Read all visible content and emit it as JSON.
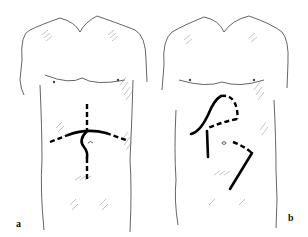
{
  "figure": {
    "panels": [
      {
        "id": "a",
        "label": "a",
        "description": "Anterior torso with vertical midline incision curving around umbilicus and transverse upper-abdominal incision",
        "incisions": [
          {
            "name": "midline-upper",
            "style": "dashed"
          },
          {
            "name": "transverse-center",
            "style": "solid"
          },
          {
            "name": "transverse-left-extension",
            "style": "dashed"
          },
          {
            "name": "transverse-right-extension",
            "style": "dashed"
          },
          {
            "name": "periumbilical-curve",
            "style": "solid"
          },
          {
            "name": "midline-lower",
            "style": "dashed"
          }
        ]
      },
      {
        "id": "b",
        "label": "b",
        "description": "Anterior torso with right subcostal incision, paramedian incision and left lower oblique flank incision",
        "incisions": [
          {
            "name": "subcostal-solid",
            "style": "solid"
          },
          {
            "name": "subcostal-dashed-extension",
            "style": "dashed"
          },
          {
            "name": "transverse-dashed",
            "style": "dashed"
          },
          {
            "name": "paramedian-vertical",
            "style": "solid"
          },
          {
            "name": "oblique-dashed",
            "style": "dashed"
          },
          {
            "name": "oblique-solid",
            "style": "solid"
          }
        ]
      }
    ],
    "colors": {
      "background": "#ffffff",
      "outline": "#222222",
      "incision": "#000000",
      "hatching": "#888888"
    }
  }
}
